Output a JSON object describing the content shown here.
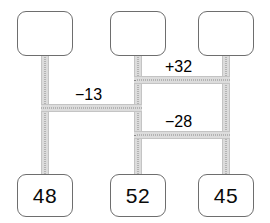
{
  "diagram": {
    "colors": {
      "box_border": "#6e6e6e",
      "box_fill": "#ffffff",
      "band_fill": "#dcdcdc",
      "band_edge": "#c4c4c4",
      "dot_line": "#8a8a8a",
      "text": "#000000",
      "background": "#ffffff"
    },
    "nodes": [
      {
        "id": "top-left",
        "label": "",
        "empty": true,
        "x": 17,
        "y": 11,
        "w": 56,
        "h": 45
      },
      {
        "id": "top-middle",
        "label": "",
        "empty": true,
        "x": 110,
        "y": 11,
        "w": 56,
        "h": 45
      },
      {
        "id": "top-right",
        "label": "",
        "empty": true,
        "x": 198,
        "y": 11,
        "w": 56,
        "h": 45
      },
      {
        "id": "bottom-left",
        "label": "48",
        "empty": false,
        "x": 17,
        "y": 174,
        "w": 56,
        "h": 43
      },
      {
        "id": "bottom-middle",
        "label": "52",
        "empty": false,
        "x": 110,
        "y": 174,
        "w": 56,
        "h": 43
      },
      {
        "id": "bottom-right",
        "label": "45",
        "empty": false,
        "x": 198,
        "y": 174,
        "w": 56,
        "h": 43
      }
    ],
    "edge_labels": [
      {
        "id": "plus-32",
        "text": "+32",
        "x": 163,
        "y": 58
      },
      {
        "id": "minus-13",
        "text": "−13",
        "x": 73,
        "y": 86
      },
      {
        "id": "minus-28",
        "text": "−28",
        "x": 163,
        "y": 113
      }
    ],
    "bands": {
      "vertical": [
        {
          "id": "v-left",
          "x": 41,
          "y": 54,
          "h": 124
        },
        {
          "id": "v-middle",
          "x": 134,
          "y": 54,
          "h": 124
        },
        {
          "id": "v-right-upper",
          "x": 222,
          "y": 54,
          "h": 124
        }
      ],
      "horizontal": [
        {
          "id": "h-plus-32",
          "x": 134,
          "y": 76,
          "w": 96
        },
        {
          "id": "h-minus-13",
          "x": 41,
          "y": 104,
          "w": 101
        },
        {
          "id": "h-minus-28",
          "x": 134,
          "y": 131,
          "w": 96
        }
      ]
    }
  }
}
